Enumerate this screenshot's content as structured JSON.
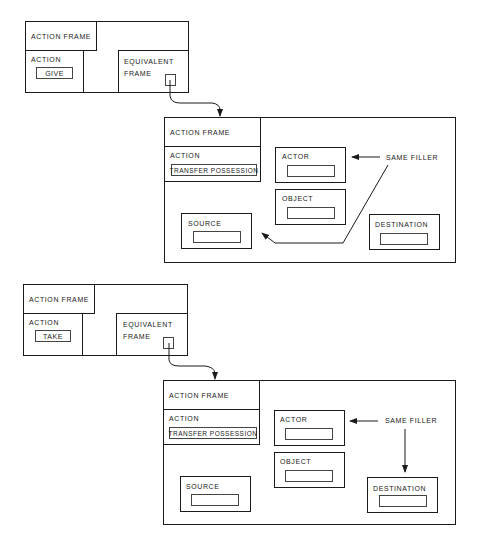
{
  "diagram_1": {
    "small_frame": {
      "header": "ACTION FRAME",
      "action_label": "ACTION",
      "action_value": "GIVE",
      "equivalent_label_line1": "EQUIVALENT",
      "equivalent_label_line2": "FRAME"
    },
    "big_frame": {
      "header": "ACTION FRAME",
      "action_label": "ACTION",
      "action_value": "TRANSFER POSSESSION",
      "actor_label": "ACTOR",
      "object_label": "OBJECT",
      "source_label": "SOURCE",
      "destination_label": "DESTINATION",
      "annotation": "SAME FILLER",
      "same_filler_target": "SOURCE"
    }
  },
  "diagram_2": {
    "small_frame": {
      "header": "ACTION FRAME",
      "action_label": "ACTION",
      "action_value": "TAKE",
      "equivalent_label_line1": "EQUIVALENT",
      "equivalent_label_line2": "FRAME"
    },
    "big_frame": {
      "header": "ACTION FRAME",
      "action_label": "ACTION",
      "action_value": "TRANSFER POSSESSION",
      "actor_label": "ACTOR",
      "object_label": "OBJECT",
      "source_label": "SOURCE",
      "destination_label": "DESTINATION",
      "annotation": "SAME FILLER",
      "same_filler_target": "DESTINATION"
    }
  },
  "colors": {
    "line": "#1a1a1a",
    "background": "#ffffff"
  }
}
